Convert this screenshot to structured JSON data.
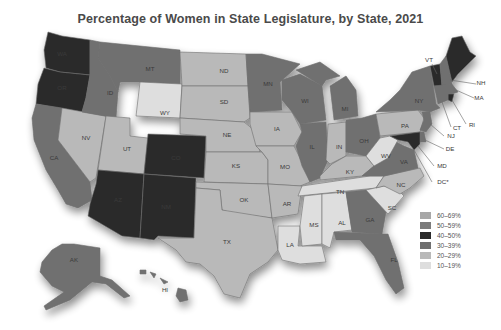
{
  "title": "Percentage of Women in State Legislature, by State, 2021",
  "legend": [
    {
      "label": "60–69%",
      "color": "#a7a7a7"
    },
    {
      "label": "50–59%",
      "color": "#7b7b7b"
    },
    {
      "label": "40–50%",
      "color": "#2a2a2a"
    },
    {
      "label": "30–39%",
      "color": "#6f6f6f"
    },
    {
      "label": "20–29%",
      "color": "#b9b9b9"
    },
    {
      "label": "10–19%",
      "color": "#dedede"
    }
  ],
  "colors": {
    "c40": "#2a2a2a",
    "c30": "#6f6f6f",
    "c20": "#b9b9b9",
    "c10": "#dedede"
  },
  "states": {
    "WA": {
      "label": "WA",
      "bracket": "40–50%"
    },
    "OR": {
      "label": "OR",
      "bracket": "40–50%"
    },
    "CA": {
      "label": "CA",
      "bracket": "30–39%"
    },
    "NV": {
      "label": "NV",
      "bracket": "20–29%"
    },
    "ID": {
      "label": "ID",
      "bracket": "30–39%"
    },
    "MT": {
      "label": "MT",
      "bracket": "30–39%"
    },
    "WY": {
      "label": "WY",
      "bracket": "10–19%"
    },
    "UT": {
      "label": "UT",
      "bracket": "20–29%"
    },
    "CO": {
      "label": "CO",
      "bracket": "40–50%"
    },
    "AZ": {
      "label": "AZ",
      "bracket": "40–50%"
    },
    "NM": {
      "label": "NM",
      "bracket": "40–50%"
    },
    "ND": {
      "label": "ND",
      "bracket": "20–29%"
    },
    "SD": {
      "label": "SD",
      "bracket": "20–29%"
    },
    "NE": {
      "label": "NE",
      "bracket": "20–29%"
    },
    "KS": {
      "label": "KS",
      "bracket": "20–29%"
    },
    "OK": {
      "label": "OK",
      "bracket": "20–29%"
    },
    "TX": {
      "label": "TX",
      "bracket": "20–29%"
    },
    "MN": {
      "label": "MN",
      "bracket": "30–39%"
    },
    "IA": {
      "label": "IA",
      "bracket": "20–29%"
    },
    "MO": {
      "label": "MO",
      "bracket": "20–29%"
    },
    "AR": {
      "label": "AR",
      "bracket": "20–29%"
    },
    "LA": {
      "label": "LA",
      "bracket": "10–19%"
    },
    "WI": {
      "label": "WI",
      "bracket": "30–39%"
    },
    "IL": {
      "label": "IL",
      "bracket": "30–39%"
    },
    "MI": {
      "label": "MI",
      "bracket": "30–39%"
    },
    "IN": {
      "label": "IN",
      "bracket": "20–29%"
    },
    "OH": {
      "label": "OH",
      "bracket": "30–39%"
    },
    "KY": {
      "label": "KY",
      "bracket": "20–29%"
    },
    "TN": {
      "label": "TN",
      "bracket": "10–19%"
    },
    "MS": {
      "label": "MS",
      "bracket": "10–19%"
    },
    "AL": {
      "label": "AL",
      "bracket": "10–19%"
    },
    "GA": {
      "label": "GA",
      "bracket": "30–39%"
    },
    "FL": {
      "label": "FL",
      "bracket": "30–39%"
    },
    "SC": {
      "label": "SC",
      "bracket": "10–19%"
    },
    "NC": {
      "label": "NC",
      "bracket": "20–29%"
    },
    "VA": {
      "label": "VA",
      "bracket": "30–39%"
    },
    "WV": {
      "label": "WV",
      "bracket": "10–19%"
    },
    "PA": {
      "label": "PA",
      "bracket": "20–29%"
    },
    "NY": {
      "label": "NY",
      "bracket": "30–39%"
    },
    "VT": {
      "label": "VT",
      "bracket": "40–50%"
    },
    "NH": {
      "label": "NH",
      "bracket": "30–39%"
    },
    "ME": {
      "label": "ME",
      "bracket": "40–50%"
    },
    "MA": {
      "label": "MA",
      "bracket": "30–39%"
    },
    "RI": {
      "label": "RI",
      "bracket": "40–50%"
    },
    "CT": {
      "label": "CT",
      "bracket": "30–39%"
    },
    "NJ": {
      "label": "NJ",
      "bracket": "30–39%"
    },
    "DE": {
      "label": "DE",
      "bracket": "30–39%"
    },
    "MD": {
      "label": "MD",
      "bracket": "40–50%"
    },
    "DC": {
      "label": "DC*",
      "bracket": ""
    },
    "AK": {
      "label": "AK",
      "bracket": "30–39%"
    },
    "HI": {
      "label": "HI",
      "bracket": "30–39%"
    }
  }
}
